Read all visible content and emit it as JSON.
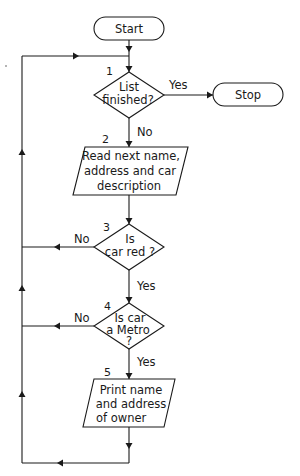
{
  "diagram": {
    "type": "flowchart",
    "nodes": {
      "start": {
        "label": "Start",
        "shape": "terminal"
      },
      "step1": {
        "number": "1",
        "lines": [
          "List",
          "finished?"
        ],
        "shape": "decision"
      },
      "stop": {
        "label": "Stop",
        "shape": "terminal"
      },
      "step2": {
        "number": "2",
        "lines": [
          "Read next name,",
          "address and car",
          "description"
        ],
        "shape": "input-output"
      },
      "step3": {
        "number": "3",
        "lines": [
          "Is",
          "car red ?"
        ],
        "shape": "decision"
      },
      "step4": {
        "number": "4",
        "lines": [
          "Is car",
          "a Metro",
          "?"
        ],
        "shape": "decision"
      },
      "step5": {
        "number": "5",
        "lines": [
          "Print name",
          "and address",
          "of owner"
        ],
        "shape": "input-output"
      }
    },
    "edges": {
      "e1_yes": "Yes",
      "e1_no": "No",
      "e3_no": "No",
      "e3_yes": "Yes",
      "e4_no": "No",
      "e4_yes": "Yes"
    },
    "colors": {
      "stroke": "#1a1a1a",
      "background": "#ffffff"
    }
  }
}
